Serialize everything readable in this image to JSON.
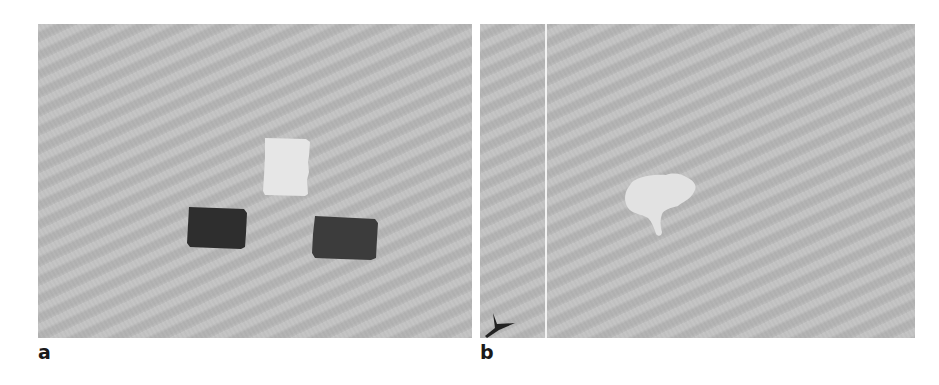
{
  "figure": {
    "panels": [
      {
        "id": "a",
        "label": "a",
        "background_color": "#bdbdbd",
        "objects": [
          {
            "name": "light-square",
            "color": "#e6e6e6"
          },
          {
            "name": "dark-square-left",
            "color": "#2e2e2e"
          },
          {
            "name": "dark-square-right",
            "color": "#3c3c3c"
          }
        ]
      },
      {
        "id": "b",
        "label": "b",
        "background_color": "#bdbdbd",
        "objects": [
          {
            "name": "light-irregular-blob",
            "color": "#e2e2e2"
          },
          {
            "name": "arrowhead-marker",
            "color": "#222222"
          },
          {
            "name": "vertical-white-line",
            "color": "#f2f2f2"
          }
        ]
      }
    ]
  }
}
